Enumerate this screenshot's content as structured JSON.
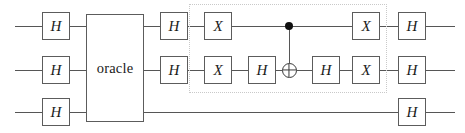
{
  "diagram": {
    "width": 465,
    "height": 133,
    "colors": {
      "background": "#ffffff",
      "wire": "#565656",
      "gate_border": "#5c5c5c",
      "gate_fill": "#ffffff",
      "gate_text": "#1a1a1a",
      "control_dot": "#101010",
      "dotted_box": "#c9c9c9"
    },
    "wires": [
      {
        "name": "qubit-0",
        "y": 26,
        "x_start": 15,
        "x_end": 455
      },
      {
        "name": "qubit-1",
        "y": 70,
        "x_start": 15,
        "x_end": 455
      },
      {
        "name": "qubit-2",
        "y": 112,
        "x_start": 15,
        "x_end": 455
      }
    ],
    "oracle": {
      "label": "oracle",
      "x": 86,
      "y": 14,
      "width": 58,
      "height": 108
    },
    "dotted_region": {
      "name": "diffusion-operator-region",
      "x": 189,
      "y": 4,
      "width": 198,
      "height": 89
    },
    "gates": [
      {
        "id": "g0",
        "label": "H",
        "wire": 0,
        "x": 42,
        "y": 12,
        "w": 28,
        "h": 28
      },
      {
        "id": "g1",
        "label": "H",
        "wire": 1,
        "x": 42,
        "y": 56,
        "w": 28,
        "h": 28
      },
      {
        "id": "g2",
        "label": "H",
        "wire": 2,
        "x": 42,
        "y": 98,
        "w": 28,
        "h": 28
      },
      {
        "id": "g3",
        "label": "H",
        "wire": 0,
        "x": 160,
        "y": 12,
        "w": 28,
        "h": 28
      },
      {
        "id": "g4",
        "label": "H",
        "wire": 1,
        "x": 160,
        "y": 56,
        "w": 28,
        "h": 28
      },
      {
        "id": "g5",
        "label": "X",
        "wire": 0,
        "x": 204,
        "y": 12,
        "w": 28,
        "h": 28
      },
      {
        "id": "g6",
        "label": "X",
        "wire": 1,
        "x": 204,
        "y": 56,
        "w": 28,
        "h": 28
      },
      {
        "id": "g7",
        "label": "H",
        "wire": 1,
        "x": 248,
        "y": 56,
        "w": 28,
        "h": 28
      },
      {
        "id": "g8",
        "label": "H",
        "wire": 1,
        "x": 312,
        "y": 56,
        "w": 28,
        "h": 28
      },
      {
        "id": "g9",
        "label": "X",
        "wire": 0,
        "x": 352,
        "y": 12,
        "w": 28,
        "h": 28
      },
      {
        "id": "g10",
        "label": "X",
        "wire": 1,
        "x": 352,
        "y": 56,
        "w": 28,
        "h": 28
      },
      {
        "id": "g11",
        "label": "H",
        "wire": 0,
        "x": 398,
        "y": 12,
        "w": 28,
        "h": 28
      },
      {
        "id": "g12",
        "label": "H",
        "wire": 1,
        "x": 398,
        "y": 56,
        "w": 28,
        "h": 28
      },
      {
        "id": "g13",
        "label": "H",
        "wire": 2,
        "x": 398,
        "y": 98,
        "w": 28,
        "h": 28
      }
    ],
    "cnot": {
      "name": "cnot-gate",
      "control_x": 289,
      "control_y": 26,
      "control_r": 4.2,
      "target_x": 289,
      "target_y": 70,
      "target_r": 7.5
    }
  }
}
